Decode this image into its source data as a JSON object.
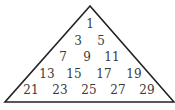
{
  "diagram": {
    "shape": "triangle",
    "stroke_color": "#222222",
    "rows": [
      {
        "values": [
          "1"
        ]
      },
      {
        "values": [
          "3",
          "5"
        ]
      },
      {
        "values": [
          "7",
          "9",
          "11"
        ]
      },
      {
        "values": [
          "13",
          "15",
          "17",
          "19"
        ]
      },
      {
        "values": [
          "21",
          "23",
          "25",
          "27",
          "29"
        ]
      }
    ]
  }
}
